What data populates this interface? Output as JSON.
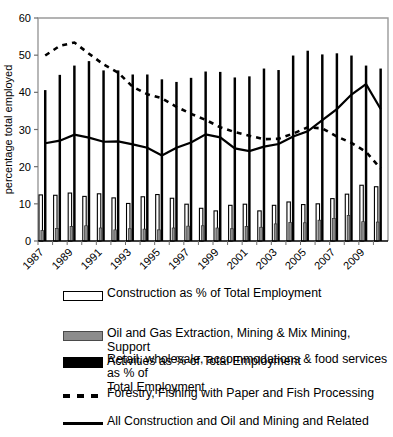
{
  "chart_data": {
    "type": "bar",
    "title": "",
    "xlabel": "",
    "ylabel": "percentage total employed",
    "ylim": [
      0,
      60
    ],
    "ytick_step": 10,
    "yticks": [
      0,
      10,
      20,
      30,
      40,
      50,
      60
    ],
    "grid": false,
    "legend_position": "below",
    "categories": [
      1987,
      1988,
      1989,
      1990,
      1991,
      1992,
      1993,
      1994,
      1995,
      1996,
      1997,
      1998,
      1999,
      2000,
      2001,
      2002,
      2003,
      2004,
      2005,
      2006,
      2007,
      2008,
      2009,
      2010
    ],
    "xtick_labels": [
      "1987",
      "1989",
      "1991",
      "1993",
      "1995",
      "1997",
      "1999",
      "2001",
      "2003",
      "2005",
      "2007",
      "2009"
    ],
    "series": [
      {
        "name": "Construction as % of Total Employment",
        "kind": "bar",
        "style": "white-fill-black-outline",
        "values": [
          12.4,
          12.3,
          12.9,
          12.0,
          12.7,
          11.6,
          10.1,
          11.9,
          12.5,
          11.5,
          9.9,
          8.8,
          8.1,
          9.6,
          9.9,
          8.1,
          9.6,
          10.5,
          9.8,
          10.0,
          11.4,
          12.6,
          15.0,
          14.6
        ]
      },
      {
        "name": "Oil and Gas Extraction, Mining & Mix Mining, Support Activities as % of Total Employment",
        "kind": "bar",
        "style": "grey-fill",
        "values": [
          2.8,
          3.4,
          3.9,
          4.1,
          3.5,
          3.0,
          3.3,
          3.2,
          3.0,
          3.5,
          4.0,
          4.1,
          3.5,
          3.3,
          3.9,
          3.7,
          4.6,
          5.0,
          4.9,
          5.6,
          6.1,
          6.9,
          5.2,
          5.1
        ]
      },
      {
        "name": "Retail, wholesale, accommodations & food services as % of Total Employment",
        "kind": "bar",
        "style": "black-fill",
        "values": [
          40.6,
          44.7,
          47.2,
          48.4,
          45.9,
          45.9,
          44.8,
          44.8,
          43.5,
          42.8,
          43.9,
          45.6,
          45.5,
          44.0,
          44.3,
          46.4,
          46.0,
          49.9,
          51.2,
          50.2,
          50.5,
          49.9,
          47.2,
          46.4
        ]
      },
      {
        "name": "Forestry, Fishing with Paper and Fish Processing",
        "kind": "line",
        "style": "dashed",
        "values": [
          49.9,
          52.5,
          53.4,
          50.4,
          47.5,
          45.3,
          41.5,
          39.5,
          38.4,
          36.1,
          34.2,
          32.6,
          30.6,
          29.3,
          28.3,
          27.4,
          27.5,
          28.9,
          30.6,
          30.3,
          28.1,
          26.4,
          24.0,
          19.5
        ]
      },
      {
        "name": "All Construction and Oil and Mining and Related",
        "kind": "line",
        "style": "solid",
        "values": [
          26.3,
          27.0,
          28.6,
          27.8,
          26.7,
          26.8,
          26.0,
          25.1,
          23.0,
          25.1,
          26.5,
          28.7,
          27.9,
          24.9,
          24.2,
          25.4,
          26.1,
          28.1,
          29.5,
          32.5,
          35.5,
          39.4,
          42.2,
          35.5
        ]
      }
    ]
  },
  "legend": {
    "items": [
      {
        "label": "Construction as % of Total Employment",
        "swatch": "bar-white",
        "color": "#ffffff"
      },
      {
        "label": "Oil and Gas Extraction, Mining & Mix Mining, Support\nActivities as % of Total Employment",
        "swatch": "bar-grey",
        "color": "#8c8c8c"
      },
      {
        "label": "Retail, wholesale, accommodations & food services as % of\nTotal Employment",
        "swatch": "bar-black",
        "color": "#000000"
      },
      {
        "label": "Forestry, Fishing with Paper and Fish Processing",
        "swatch": "line-dashed",
        "color": "#000000"
      },
      {
        "label": "All Construction and Oil and Mining and Related",
        "swatch": "line-solid",
        "color": "#000000"
      }
    ]
  },
  "axis": {
    "y_title": "percentage total employed"
  },
  "colors": {
    "black": "#000000",
    "grey": "#8c8c8c",
    "white": "#ffffff",
    "frame": "#9a9a9a"
  }
}
